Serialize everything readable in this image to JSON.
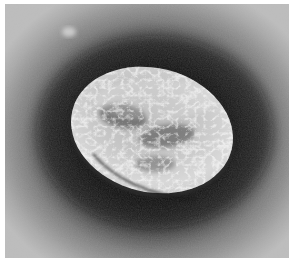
{
  "image": {
    "kind": "electron-micrograph",
    "description": "Negatively stained oval virion with wrinkled, convoluted surface on a dark halo background",
    "subject": "virus-particle",
    "palette": {
      "background_light": "#b9b9b9",
      "background_mid": "#8a8a8a",
      "halo_dark": "#141414",
      "particle_light": "#e2e2e2",
      "particle_mid": "#a8a8a8",
      "particle_shadow": "#3a3a3a"
    },
    "caption": "",
    "scale_bar": ""
  }
}
